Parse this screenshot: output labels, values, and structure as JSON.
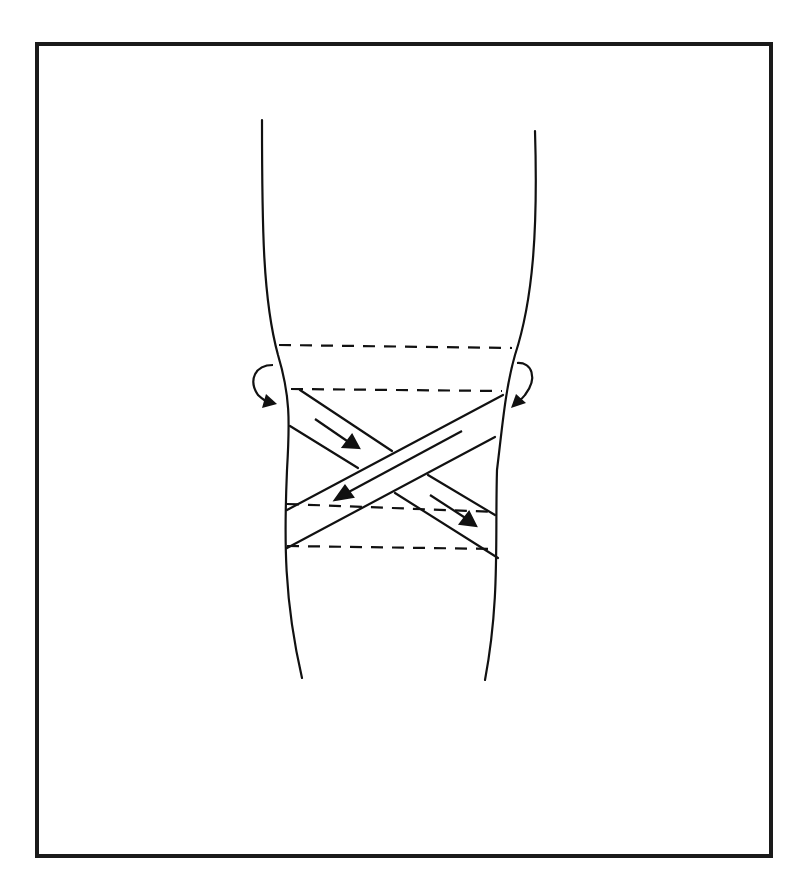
{
  "diagram": {
    "line_color": "#111111",
    "background": "#ffffff",
    "elements": {
      "leg_outline": "two curved lines outlining a leg",
      "anchor_strips": "four dashed horizontal anchor lines",
      "tape_strips": "two crossing diagonal tape strips forming an X",
      "arrows": "direction arrows along each strip and two curved wrap arrows at the sides"
    }
  }
}
